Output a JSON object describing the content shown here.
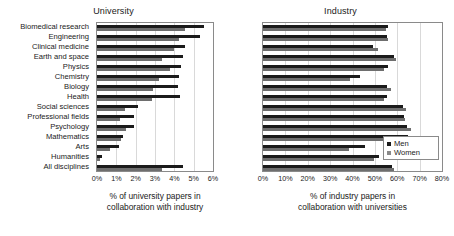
{
  "chart_data": [
    {
      "type": "bar",
      "orientation": "horizontal",
      "title": "University",
      "xlabel": "% of university papers in collaboration with industry",
      "ylabel": "",
      "xlim": [
        0,
        6
      ],
      "xticks": [
        "0%",
        "1%",
        "2%",
        "3%",
        "4%",
        "5%",
        "6%"
      ],
      "xtick_values": [
        0,
        1,
        2,
        3,
        4,
        5,
        6
      ],
      "grid": true,
      "legend": [
        "Men",
        "Women"
      ],
      "legend_position": "right-chart-inside-bottom-right",
      "categories": [
        "Biomedical research",
        "Engineering",
        "Clinical medicine",
        "Earth and space",
        "Physics",
        "Chemistry",
        "Biology",
        "Health",
        "Social sciences",
        "Professional fields",
        "Psychology",
        "Mathematics",
        "Arts",
        "Humanities",
        "All disciplines"
      ],
      "series": [
        {
          "name": "Men",
          "color": "#1b1b1b",
          "values": [
            5.55,
            5.35,
            4.55,
            4.45,
            4.35,
            4.25,
            4.2,
            4.3,
            2.1,
            1.9,
            1.9,
            1.35,
            1.15,
            0.28,
            4.45
          ]
        },
        {
          "name": "Women",
          "color": "#6e6e6e",
          "values": [
            4.55,
            4.25,
            4.0,
            3.35,
            3.75,
            3.2,
            2.9,
            2.85,
            1.45,
            1.2,
            1.5,
            1.25,
            0.65,
            0.15,
            3.35
          ]
        }
      ]
    },
    {
      "type": "bar",
      "orientation": "horizontal",
      "title": "Industry",
      "xlabel": "% of industry papers in collaboration with universities",
      "ylabel": "",
      "xlim": [
        0,
        80
      ],
      "xticks": [
        "0%",
        "10%",
        "20%",
        "30%",
        "40%",
        "50%",
        "60%",
        "70%",
        "80%"
      ],
      "xtick_values": [
        0,
        10,
        20,
        30,
        40,
        50,
        60,
        70,
        80
      ],
      "grid": true,
      "legend": [
        "Men",
        "Women"
      ],
      "categories": [
        "Biomedical research",
        "Engineering",
        "Clinical medicine",
        "Earth and space",
        "Physics",
        "Chemistry",
        "Biology",
        "Health",
        "Social sciences",
        "Professional fields",
        "Psychology",
        "Mathematics",
        "Arts",
        "Humanities",
        "All disciplines"
      ],
      "series": [
        {
          "name": "Men",
          "color": "#1b1b1b",
          "values": [
            56.0,
            55.5,
            49.0,
            58.5,
            56.0,
            43.5,
            55.5,
            55.5,
            62.5,
            63.0,
            64.5,
            65.0,
            45.5,
            52.0,
            57.5
          ]
        },
        {
          "name": "Women",
          "color": "#6e6e6e",
          "values": [
            55.0,
            56.0,
            51.5,
            59.5,
            54.0,
            39.0,
            57.0,
            54.0,
            64.0,
            63.5,
            66.0,
            66.0,
            38.5,
            49.5,
            58.5
          ]
        }
      ]
    }
  ],
  "legend": {
    "men_label": "Men",
    "women_label": "Women"
  },
  "colors": {
    "men": "#1b1b1b",
    "women": "#6e6e6e",
    "axis": "#8a8a8a",
    "grid": "#d9d9d9",
    "background": "#ffffff"
  },
  "left_caption_line1": "% of university papers in",
  "left_caption_line2": "collaboration with industry",
  "right_caption_line1": "% of industry papers in",
  "right_caption_line2": "collaboration with universities"
}
